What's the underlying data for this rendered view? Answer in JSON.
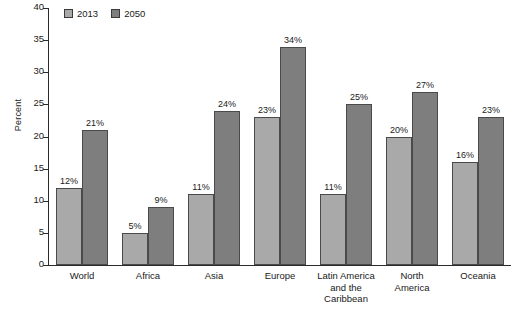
{
  "chart_data": {
    "type": "bar",
    "title": "",
    "xlabel": "",
    "ylabel": "Percent",
    "ylim": [
      0,
      40
    ],
    "ytick_step": 5,
    "yticks": [
      0,
      5,
      10,
      15,
      20,
      25,
      30,
      35,
      40
    ],
    "grid": false,
    "legend_position": "top-left",
    "value_suffix": "%",
    "categories": [
      "World",
      "Africa",
      "Asia",
      "Europe",
      "Latin America and the Caribbean",
      "North America",
      "Oceania"
    ],
    "category_lines": [
      [
        "World"
      ],
      [
        "Africa"
      ],
      [
        "Asia"
      ],
      [
        "Europe"
      ],
      [
        "Latin America",
        "and the",
        "Caribbean"
      ],
      [
        "North",
        "America"
      ],
      [
        "Oceania"
      ]
    ],
    "series": [
      {
        "name": "2013",
        "color": "#a9a9a9",
        "values": [
          12,
          5,
          11,
          23,
          11,
          20,
          16
        ],
        "labels": [
          "12%",
          "5%",
          "11%",
          "23%",
          "11%",
          "20%",
          "16%"
        ]
      },
      {
        "name": "2050",
        "color": "#7e7e7e",
        "values": [
          21,
          9,
          24,
          34,
          25,
          27,
          23
        ],
        "labels": [
          "21%",
          "9%",
          "24%",
          "34%",
          "25%",
          "27%",
          "23%"
        ]
      }
    ]
  },
  "legend": {
    "items": [
      {
        "label": "2013",
        "color": "#a9a9a9"
      },
      {
        "label": "2050",
        "color": "#7e7e7e"
      }
    ]
  },
  "axis": {
    "y_label": "Percent",
    "y_tick_labels": [
      "40",
      "35",
      "30",
      "25",
      "20",
      "15",
      "10",
      "5",
      "0"
    ]
  }
}
